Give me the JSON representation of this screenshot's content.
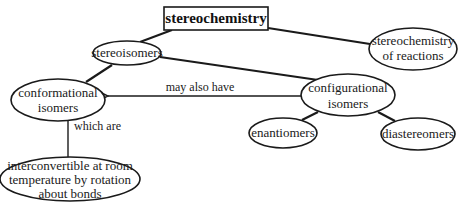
{
  "diagram": {
    "title": "stereochemistry",
    "nodes": {
      "stereoisomers": {
        "lines": [
          "stereoisomers"
        ]
      },
      "reactions": {
        "lines": [
          "stereochemistry",
          "of reactions"
        ]
      },
      "conformational": {
        "lines": [
          "conformational",
          "isomers"
        ]
      },
      "configurational": {
        "lines": [
          "configurational",
          "isomers"
        ]
      },
      "enantiomers": {
        "lines": [
          "enantiomers"
        ]
      },
      "diastereomers": {
        "lines": [
          "diastereomers"
        ]
      },
      "interconvertible": {
        "lines": [
          "interconvertible at room",
          "temperature by rotation",
          "about bonds"
        ]
      }
    },
    "links": {
      "may_also_have": "may also have",
      "which_are": "which are"
    },
    "colors": {
      "stroke": "#1a1a1a",
      "background": "#ffffff"
    }
  }
}
